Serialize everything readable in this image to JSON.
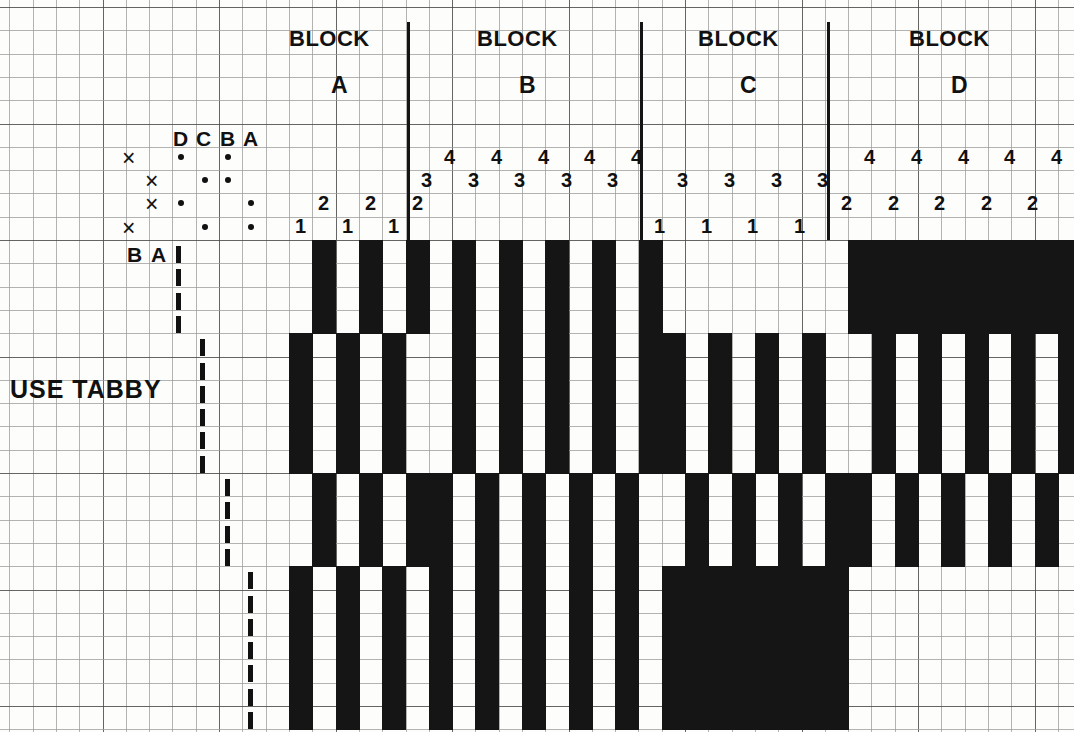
{
  "diagram": {
    "kind": "weaving-draft",
    "note_text": "USE TABBY",
    "grid": {
      "cell_size": 23.3,
      "cols": 47,
      "rows": 32
    },
    "blocks": [
      {
        "id": "A",
        "word": "BLOCK",
        "letter": "A",
        "threads": [
          "1",
          "2",
          "1",
          "2",
          "1",
          "2"
        ]
      },
      {
        "id": "B",
        "word": "BLOCK",
        "letter": "B",
        "threads": [
          "3",
          "4",
          "3",
          "4",
          "3",
          "4",
          "3",
          "4",
          "3",
          "4"
        ]
      },
      {
        "id": "C",
        "word": "BLOCK",
        "letter": "C",
        "threads": [
          "1",
          "3",
          "1",
          "3",
          "1",
          "3",
          "1",
          "3"
        ]
      },
      {
        "id": "D",
        "word": "BLOCK",
        "letter": "D",
        "threads": [
          "2",
          "4",
          "2",
          "4",
          "2",
          "4",
          "2",
          "4",
          "2",
          "4"
        ]
      }
    ],
    "tieup": {
      "column_headers": [
        "D",
        "C",
        "B",
        "A"
      ],
      "row_headers": [
        "B",
        "A"
      ],
      "treadle_marks": [
        "×",
        "×",
        "×",
        "×"
      ],
      "rows": [
        {
          "marks": [
            "D",
            "B"
          ]
        },
        {
          "marks": [
            "C",
            "B"
          ]
        },
        {
          "marks": [
            "D",
            "A"
          ]
        },
        {
          "marks": [
            "C",
            "A"
          ]
        }
      ]
    },
    "treadling": {
      "label": "treadling-sequence",
      "segments": [
        {
          "treadle": 1,
          "start_row": 0,
          "length": 4
        },
        {
          "treadle": 3,
          "start_row": 4,
          "length": 6
        },
        {
          "treadle": 2,
          "start_row": 10,
          "length": 4
        },
        {
          "treadle": 4,
          "start_row": 14,
          "length": 7
        }
      ]
    },
    "drawdown": {
      "origin_x": 289,
      "origin_y": 240,
      "cell": 23.3,
      "columns": 34,
      "rows": 21,
      "pattern": [
        "0110110110000000000000000000000000",
        "0110110110000000000000000000000000",
        "0110110110000000000000000000000000",
        "0110110110000000000000000000000000",
        "0000000000000000000000000000000000",
        "0000000000000000000000000000000000",
        "0000000000000000000000000000000000",
        "0000000000000000000000000000000000",
        "0000000000000000000000000000000000",
        "0000000000000000000000000000000000",
        "1101101100000000000000000000000000",
        "1101101100000000000000000000000000",
        "1101101100000000000000000000000000",
        "1101101100000000000000000000000000",
        "1111110000000000000000000000000000",
        "1111110000000000000000000000000000",
        "1111110000000000000000000000000000",
        "1111110000000000000000000000000000",
        "1111110000000000000000000000000000",
        "1111110000000000000000000000000000",
        "1111110000000000000000000000000000"
      ]
    }
  }
}
